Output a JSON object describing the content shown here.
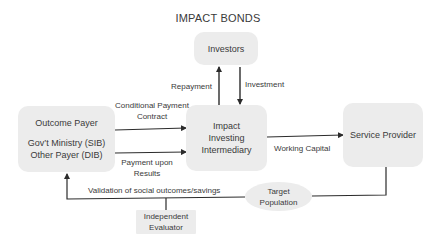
{
  "diagram": {
    "title": "IMPACT BONDS",
    "nodes": {
      "investors": {
        "label": "Investors"
      },
      "intermediary": {
        "lines": [
          "Impact",
          "Investing",
          "Intermediary"
        ]
      },
      "outcome_payer": {
        "lines": [
          "Outcome Payer",
          "Gov’t Ministry (SIB)",
          "Other Payer (DIB)"
        ]
      },
      "service_provider": {
        "label": "Service Provider"
      },
      "target_population": {
        "lines": [
          "Target",
          "Population"
        ]
      },
      "independent_evaluator": {
        "lines": [
          "Independent",
          "Evaluator"
        ]
      }
    },
    "edges": {
      "repayment": {
        "label": "Repayment",
        "from": "intermediary",
        "to": "investors"
      },
      "investment": {
        "label": "Investment",
        "from": "investors",
        "to": "intermediary"
      },
      "conditional_payment_contract": {
        "lines": [
          "Conditional Payment",
          "Contract"
        ],
        "from": "outcome_payer",
        "to": "intermediary"
      },
      "payment_upon_results": {
        "lines": [
          "Payment upon",
          "Results"
        ],
        "from": "outcome_payer",
        "to": "intermediary"
      },
      "working_capital": {
        "label": "Working Capital",
        "from": "intermediary",
        "to": "service_provider"
      },
      "validation": {
        "label": "Validation of social outcomes/savings",
        "from": "service_provider",
        "to": "outcome_payer",
        "via": [
          "target_population",
          "independent_evaluator"
        ]
      }
    },
    "colors": {
      "box_fill": "#ececec",
      "line": "#2b2b2b",
      "text": "#3a3a3a"
    }
  }
}
